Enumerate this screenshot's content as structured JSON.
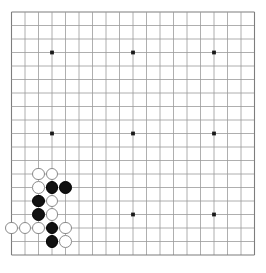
{
  "app": {
    "title": "Go Board",
    "board_label": "go-board-19x19"
  },
  "board": {
    "size": 19,
    "origin_x": 11.5,
    "origin_y": 12.0,
    "spacing": 13.5,
    "line_color": "#9a9a9a",
    "edge_color": "#7d7d7d",
    "star_color": "#1a1a1a",
    "background_color": "#ffffff",
    "star_radius": 1.9,
    "stone_radius": 6.4,
    "star_points": [
      [
        3,
        3
      ],
      [
        9,
        3
      ],
      [
        15,
        3
      ],
      [
        3,
        9
      ],
      [
        9,
        9
      ],
      [
        15,
        9
      ],
      [
        3,
        15
      ],
      [
        9,
        15
      ],
      [
        15,
        15
      ]
    ]
  },
  "stones": {
    "black_color": "#111111",
    "white_color": "#ffffff",
    "black": [
      [
        3,
        13
      ],
      [
        4,
        13
      ],
      [
        2,
        14
      ],
      [
        2,
        15
      ],
      [
        3,
        16
      ],
      [
        3,
        17
      ]
    ],
    "white": [
      [
        2,
        12
      ],
      [
        3,
        12
      ],
      [
        2,
        13
      ],
      [
        3,
        14
      ],
      [
        3,
        15
      ],
      [
        0,
        16
      ],
      [
        1,
        16
      ],
      [
        2,
        16
      ],
      [
        4,
        16
      ],
      [
        4,
        17
      ]
    ]
  }
}
